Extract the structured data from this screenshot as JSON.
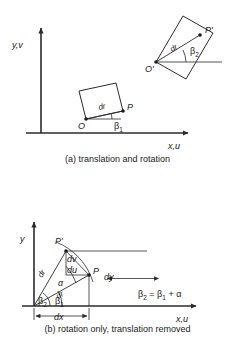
{
  "figure": {
    "panels": [
      {
        "id": "a",
        "caption": "(a) translation and rotation",
        "axis_y_label": "y,v",
        "axis_x_label": "x,u",
        "elements": {
          "origin_lower": "O",
          "point_lower": "P",
          "vector_lower": "dr",
          "angle_lower": "β",
          "angle_lower_sub": "1",
          "origin_upper": "O'",
          "point_upper": "P'",
          "vector_upper": "dr",
          "angle_upper": "β",
          "angle_upper_sub": "2"
        }
      },
      {
        "id": "b",
        "caption": "(b) rotation only, translation removed",
        "axis_y_label": "y",
        "axis_x_label": "x,u",
        "elements": {
          "point_p": "P",
          "point_p_prime": "P'",
          "vector_initial": "dr",
          "vector_rotated": "dr",
          "angle_alpha": "α",
          "angle_beta1": "β",
          "angle_beta1_sub": "1",
          "angle_beta2": "β",
          "angle_beta2_sub": "2",
          "delta_u": "du",
          "delta_v": "dv",
          "dim_x": "dx",
          "dim_y": "dy"
        },
        "equation": {
          "lhs": "β",
          "lhs_sub": "2",
          "operator": "=",
          "rhs_first": "β",
          "rhs_first_sub": "1",
          "rhs_plus": "+",
          "rhs_second": "α",
          "full": "β2 = β1 + α"
        }
      }
    ],
    "colors": {
      "ink": "#1a1a1a",
      "line": "#2b2b2b",
      "background": "#ffffff"
    }
  }
}
